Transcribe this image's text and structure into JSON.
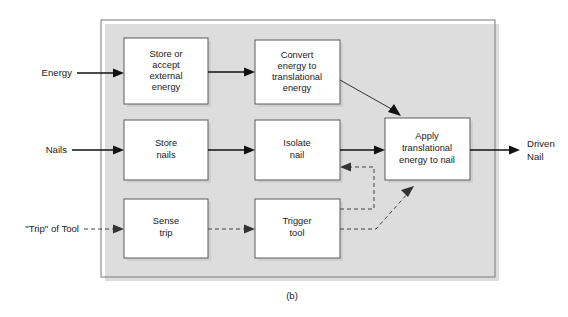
{
  "figure": {
    "caption": "(b)",
    "boundary_name": "system-boundary"
  },
  "inputs": [
    {
      "id": "energy",
      "label": "Energy",
      "line_style": "solid"
    },
    {
      "id": "nails",
      "label": "Nails",
      "line_style": "solid"
    },
    {
      "id": "trip",
      "label": "\"Trip\" of Tool",
      "line_style": "dashed"
    }
  ],
  "outputs": [
    {
      "id": "driven-nail",
      "label_line1": "Driven",
      "label_line2": "Nail",
      "line_style": "solid"
    }
  ],
  "blocks": [
    {
      "id": "store-accept-external-energy",
      "lines": [
        "Store or",
        "accept",
        "external",
        "energy"
      ]
    },
    {
      "id": "convert-energy-to-translational-energy",
      "lines": [
        "Convert",
        "energy to",
        "translational",
        "energy"
      ]
    },
    {
      "id": "store-nails",
      "lines": [
        "Store",
        "nails"
      ]
    },
    {
      "id": "isolate-nail",
      "lines": [
        "Isolate",
        "nail"
      ]
    },
    {
      "id": "sense-trip",
      "lines": [
        "Sense",
        "trip"
      ]
    },
    {
      "id": "trigger-tool",
      "lines": [
        "Trigger",
        "tool"
      ]
    },
    {
      "id": "apply-translational-energy-to-nail",
      "lines": [
        "Apply",
        "translational",
        "energy to nail"
      ]
    }
  ],
  "connections": [
    {
      "id": "energy-to-store-accept",
      "from": "energy",
      "to": "store-accept-external-energy",
      "style": "solid"
    },
    {
      "id": "store-accept-to-convert",
      "from": "store-accept-external-energy",
      "to": "convert-energy-to-translational-energy",
      "style": "solid"
    },
    {
      "id": "convert-to-apply",
      "from": "convert-energy-to-translational-energy",
      "to": "apply-translational-energy-to-nail",
      "style": "solid"
    },
    {
      "id": "nails-to-store-nails",
      "from": "nails",
      "to": "store-nails",
      "style": "solid"
    },
    {
      "id": "store-nails-to-isolate",
      "from": "store-nails",
      "to": "isolate-nail",
      "style": "solid"
    },
    {
      "id": "isolate-to-apply",
      "from": "isolate-nail",
      "to": "apply-translational-energy-to-nail",
      "style": "solid"
    },
    {
      "id": "trip-to-sense",
      "from": "trip",
      "to": "sense-trip",
      "style": "dashed"
    },
    {
      "id": "sense-to-trigger",
      "from": "sense-trip",
      "to": "trigger-tool",
      "style": "dashed"
    },
    {
      "id": "trigger-to-isolate",
      "from": "trigger-tool",
      "to": "isolate-nail",
      "style": "dashed"
    },
    {
      "id": "trigger-to-apply",
      "from": "trigger-tool",
      "to": "apply-translational-energy-to-nail",
      "style": "dashed"
    },
    {
      "id": "apply-to-driven-nail",
      "from": "apply-translational-energy-to-nail",
      "to": "driven-nail",
      "style": "solid"
    }
  ],
  "colors": {
    "box_stroke": "#5a5a5a",
    "container_stroke": "#7a7a7a",
    "arrow_solid": "#111111",
    "arrow_dashed": "#444444",
    "shadow": "#c9c9c9",
    "text": "#1a1a1a",
    "background": "#ffffff"
  }
}
